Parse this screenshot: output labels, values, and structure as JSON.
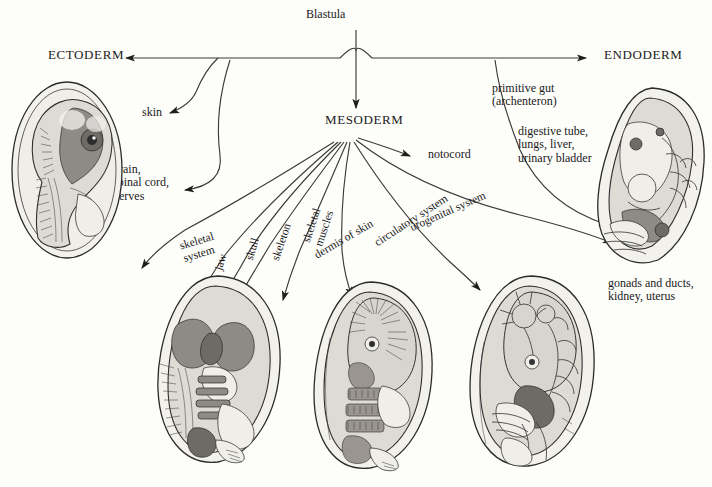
{
  "diagram": {
    "title": "Blastula",
    "type": "germ-layer-derivatives-flowchart"
  },
  "germ_layers": {
    "ectoderm": "ECTODERM",
    "mesoderm": "MESODERM",
    "endoderm": "ENDODERM"
  },
  "labels": {
    "skin": "skin",
    "neural": "brain,\nspinal cord,\nnerves",
    "primitive_gut": "primitive gut\n(archenteron)",
    "digestive": "digestive tube,\nlungs, liver,\nurinary bladder",
    "gonads": "gonads and ducts,\nkidney, uterus",
    "notocord": "notocord",
    "skeletal_system": "skeletal\nsystem",
    "jaw": "jaw",
    "skull": "skull",
    "skeleton": "skeleton",
    "skeletal_muscles": "skeletal\nmuscles",
    "dermis": "dermis of skin",
    "circulatory": "circulatory system",
    "urogenital": "urogenital system"
  },
  "embryos": [
    {
      "id": "ectoderm-embryo",
      "name": "nervous-system-embryo",
      "caption": "brain, spinal cord, nerves"
    },
    {
      "id": "endoderm-embryo",
      "name": "digestive-urogenital-embryo",
      "caption": "gonads and ducts, kidney, uterus"
    },
    {
      "id": "skeleton-embryo",
      "name": "skeletal-system-embryo",
      "caption": "skeletal system"
    },
    {
      "id": "muscle-embryo",
      "name": "muscular-system-embryo",
      "caption": "skeletal muscles / dermis of skin"
    },
    {
      "id": "circulatory-embryo",
      "name": "circulatory-system-embryo",
      "caption": "circulatory system"
    }
  ],
  "colors": {
    "background": "#fdfdfa",
    "ink": "#1a1a1a",
    "line": "#3a3a3a",
    "tissue_dark": "#8e8b85",
    "tissue_light": "#dedbd4"
  }
}
